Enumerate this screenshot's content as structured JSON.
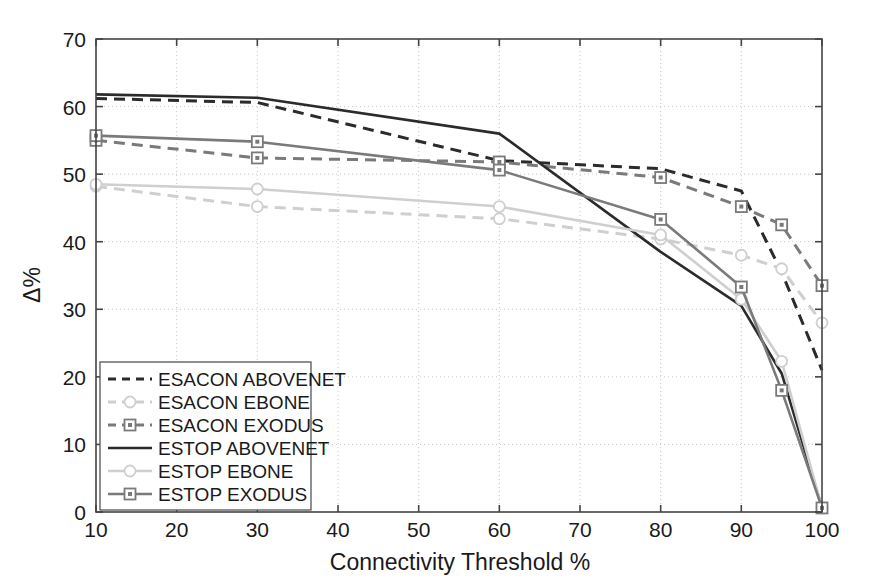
{
  "chart_data": {
    "type": "line",
    "title": "",
    "xlabel": "Connectivity Threshold %",
    "ylabel": "Δ%",
    "xlim": [
      10,
      100
    ],
    "ylim": [
      0,
      70
    ],
    "xticks": [
      10,
      20,
      30,
      40,
      50,
      60,
      70,
      80,
      90,
      100
    ],
    "yticks": [
      0,
      10,
      20,
      30,
      40,
      50,
      60,
      70
    ],
    "grid": true,
    "grid_style": "dotted",
    "legend_position": "lower left",
    "series": [
      {
        "name": "ESACON ABOVENET",
        "color": "#2b2b2b",
        "dash": "dashed",
        "marker": "none",
        "x": [
          10,
          30,
          60,
          80,
          90,
          95,
          100
        ],
        "values": [
          61.2,
          60.6,
          52.0,
          50.8,
          47.5,
          35.5,
          21.0
        ]
      },
      {
        "name": "ESACON EBONE",
        "color": "#cfcfcf",
        "dash": "dashed",
        "marker": "circle",
        "x": [
          10,
          30,
          60,
          80,
          90,
          95,
          100
        ],
        "values": [
          48.2,
          45.2,
          43.4,
          40.4,
          38.0,
          36.0,
          28.0
        ]
      },
      {
        "name": "ESACON EXODUS",
        "color": "#7a7a7a",
        "dash": "dashed",
        "marker": "square",
        "x": [
          10,
          30,
          60,
          80,
          90,
          95,
          100
        ],
        "values": [
          55.0,
          52.4,
          51.8,
          49.5,
          45.2,
          42.5,
          33.5
        ]
      },
      {
        "name": "ESTOP ABOVENET",
        "color": "#2b2b2b",
        "dash": "solid",
        "marker": "none",
        "x": [
          10,
          30,
          60,
          80,
          90,
          95,
          100
        ],
        "values": [
          61.8,
          61.3,
          56.0,
          38.5,
          30.5,
          20.5,
          0.6
        ]
      },
      {
        "name": "ESTOP EBONE",
        "color": "#cfcfcf",
        "dash": "solid",
        "marker": "circle",
        "x": [
          10,
          30,
          60,
          80,
          90,
          95,
          100
        ],
        "values": [
          48.5,
          47.8,
          45.2,
          41.0,
          31.5,
          22.3,
          0.6
        ]
      },
      {
        "name": "ESTOP EXODUS",
        "color": "#7a7a7a",
        "dash": "solid",
        "marker": "square",
        "x": [
          10,
          30,
          60,
          80,
          90,
          95,
          100
        ],
        "values": [
          55.7,
          54.8,
          50.6,
          43.3,
          33.3,
          18.0,
          0.6
        ]
      }
    ]
  }
}
